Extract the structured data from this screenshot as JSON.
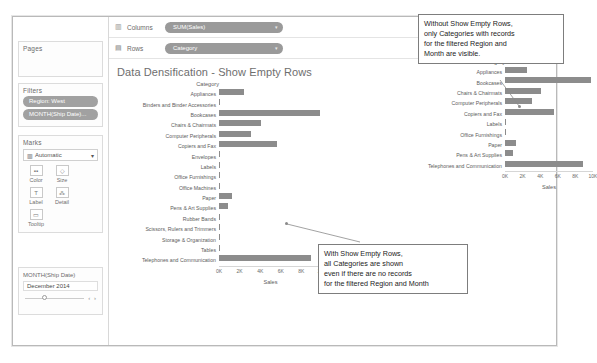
{
  "window": {
    "title": "Data Densification - Show Empty Rows"
  },
  "sidebar": {
    "pages": {
      "title": "Pages"
    },
    "filters": {
      "title": "Filters",
      "pills": [
        {
          "label": "Region: West"
        },
        {
          "label": "MONTH(Ship Date)..."
        }
      ]
    },
    "marks": {
      "title": "Marks",
      "type_label": "Automatic",
      "type_icon": "bar-chart-icon",
      "caret": "▾",
      "buttons": [
        {
          "label": "Color",
          "icon": "color-icon",
          "glyph": "▪▪"
        },
        {
          "label": "Size",
          "icon": "size-icon",
          "glyph": "◇"
        },
        {
          "label": "Label",
          "icon": "label-icon",
          "glyph": "T"
        },
        {
          "label": "Detail",
          "icon": "detail-icon",
          "glyph": "⁂"
        },
        {
          "label": "Tooltip",
          "icon": "tooltip-icon",
          "glyph": "▭"
        }
      ]
    },
    "month_card": {
      "title": "MONTH(Ship Date)",
      "value": "December 2014",
      "prev_arrow": "‹",
      "next_arrow": "›"
    }
  },
  "shelves": [
    {
      "name": "columns",
      "icon": "columns-icon",
      "glyph": "▥",
      "label": "Columns",
      "pill": "SUM(Sales)",
      "caret": "▾"
    },
    {
      "name": "rows",
      "icon": "rows-icon",
      "glyph": "▤",
      "label": "Rows",
      "pill": "Category",
      "caret": "▾"
    }
  ],
  "annotations": {
    "top": [
      "Without Show Empty Rows,",
      "only Categories with records",
      "for the filtered Region and",
      "Month are visible."
    ],
    "bottom": [
      "With Show Empty Rows,",
      "all Categories are shown",
      "even if there are no records",
      "for the filtered Region and Month"
    ]
  },
  "chart_data": [
    {
      "id": "left",
      "type": "bar",
      "title": "Data Densification - Show Empty Rows",
      "row_header": "Category",
      "xlabel": "Sales",
      "ylabel": "Category",
      "xlim": [
        0,
        10000
      ],
      "ticks": [
        "0K",
        "2K",
        "4K",
        "6K",
        "8K",
        "10K"
      ],
      "tick_values": [
        0,
        2000,
        4000,
        6000,
        8000,
        10000
      ],
      "grid": false,
      "categories": [
        "Appliances",
        "Binders and Binder Accessories",
        "Bookcases",
        "Chairs & Chairmats",
        "Computer Peripherals",
        "Copiers and Fax",
        "Envelopes",
        "Labels",
        "Office Furnishings",
        "Office Machines",
        "Paper",
        "Pens & Art Supplies",
        "Rubber Bands",
        "Scissors, Rulers and Trimmers",
        "Storage & Organization",
        "Tables",
        "Telephones and Communication"
      ],
      "values": [
        2450,
        0,
        9800,
        4050,
        3100,
        5600,
        0,
        90,
        110,
        0,
        1300,
        900,
        0,
        0,
        0,
        0,
        8900
      ]
    },
    {
      "id": "right",
      "type": "bar",
      "row_header": "Category",
      "xlabel": "Sales",
      "ylabel": "Category",
      "xlim": [
        0,
        10000
      ],
      "ticks": [
        "0K",
        "2K",
        "4K",
        "6K",
        "8K",
        "10K"
      ],
      "tick_values": [
        0,
        2000,
        4000,
        6000,
        8000,
        10000
      ],
      "grid": false,
      "categories": [
        "Appliances",
        "Bookcases",
        "Chairs & Chairmats",
        "Computer Peripherals",
        "Copiers and Fax",
        "Labels",
        "Office Furnishings",
        "Paper",
        "Pens & Art Supplies",
        "Telephones and Communication"
      ],
      "values": [
        2450,
        9800,
        4050,
        3100,
        5600,
        90,
        110,
        1300,
        900,
        8900
      ]
    }
  ],
  "colors": {
    "bar": "#8c8c8c",
    "pill": "#9a9a9a",
    "text": "#5c5c5c",
    "note_border": "#7d7d7d"
  }
}
